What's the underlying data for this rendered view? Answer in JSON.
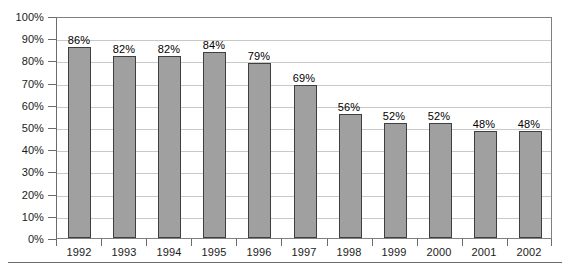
{
  "chart_data": {
    "type": "bar",
    "title": "",
    "subtitle": "",
    "xlabel": "",
    "ylabel": "",
    "categories": [
      "1992",
      "1993",
      "1994",
      "1995",
      "1996",
      "1997",
      "1998",
      "1999",
      "2000",
      "2001",
      "2002"
    ],
    "values": [
      86,
      82,
      82,
      84,
      79,
      69,
      56,
      52,
      52,
      48,
      48
    ],
    "data_labels": [
      "86%",
      "82%",
      "82%",
      "84%",
      "79%",
      "69%",
      "56%",
      "52%",
      "52%",
      "48%",
      "48%"
    ],
    "ylim": [
      0,
      100
    ],
    "ytick_values": [
      0,
      10,
      20,
      30,
      40,
      50,
      60,
      70,
      80,
      90,
      100
    ],
    "ytick_labels": [
      "0%",
      "10%",
      "20%",
      "30%",
      "40%",
      "50%",
      "60%",
      "70%",
      "80%",
      "90%",
      "100%"
    ],
    "grid": true,
    "grid_axis": "y",
    "legend": false,
    "legend_position": "none",
    "bar_color": "#a0a0a0",
    "bar_edge_color": "#3f3f3f",
    "grid_color": "#c8c8c8",
    "axis_color": "#6b6b6b",
    "background_color": "#ffffff",
    "text_color": "#1a1a1a"
  }
}
